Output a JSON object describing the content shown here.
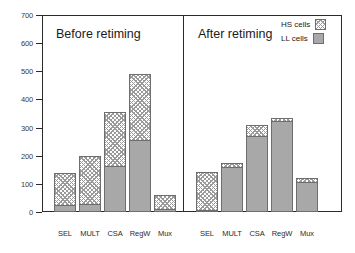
{
  "chart_data": {
    "type": "bar",
    "subtype": "stacked-bar-two-panel",
    "title": "",
    "xlabel": "",
    "ylabel": "",
    "ylim": [
      0,
      700
    ],
    "yticks": [
      0,
      100,
      200,
      300,
      400,
      500,
      600,
      700
    ],
    "grid": false,
    "legend_position": "top-right",
    "categories": [
      "SEL",
      "MULT",
      "CSA",
      "RegW",
      "Mux"
    ],
    "panels": [
      {
        "title": "Before retiming",
        "series": [
          {
            "name": "LL cells",
            "values": [
              25,
              30,
              165,
              255,
              10
            ]
          },
          {
            "name": "HS cells",
            "values": [
              115,
              170,
              190,
              235,
              50
            ]
          }
        ],
        "totals": [
          140,
          200,
          355,
          490,
          60
        ]
      },
      {
        "title": "After retiming",
        "series": [
          {
            "name": "LL cells",
            "values": [
              5,
              160,
              270,
              322,
              105
            ]
          },
          {
            "name": "HS cells",
            "values": [
              135,
              15,
              40,
              13,
              15
            ]
          }
        ],
        "totals": [
          140,
          175,
          310,
          335,
          120
        ]
      }
    ],
    "legend": [
      {
        "label": "HS cells",
        "fill": "hatch",
        "color": "#9a9a9a"
      },
      {
        "label": "LL cells",
        "fill": "solid",
        "color": "#a8a8a8"
      }
    ],
    "colors": {
      "ll_cells": "#a8a8a8",
      "hs_cells": "#9a9a9a",
      "axis": "#2b2b2b",
      "background": "#ffffff"
    }
  }
}
